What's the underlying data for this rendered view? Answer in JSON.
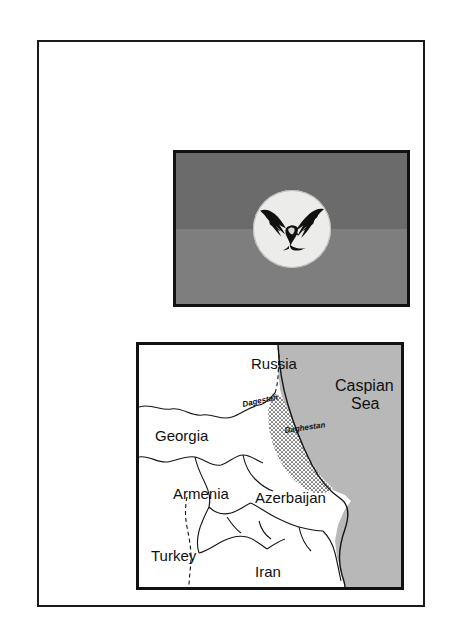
{
  "page": {
    "background_color": "#ffffff",
    "frame_color": "#1a1a1a"
  },
  "flag": {
    "name": "flag-of-dagestan-style-banner",
    "border_color": "#111111",
    "band_top_color": "#6b6b6b",
    "band_bottom_color": "#7e7e7e",
    "emblem": {
      "name": "eagle-emblem",
      "disc_color": "#ececea",
      "bird_color": "#111111",
      "description": "black eagle with spread wings on a pale disc"
    }
  },
  "map": {
    "name": "caucasus-caspian-region-map",
    "border_color": "#111111",
    "land_color": "#ffffff",
    "sea_color": "#b8b8b8",
    "boundary_color": "#141414",
    "sea_labels": [
      {
        "text": "Caspian",
        "x": 196,
        "y": 46
      },
      {
        "text": "Sea",
        "x": 212,
        "y": 64
      }
    ],
    "country_labels": [
      {
        "text": "Russia",
        "x": 112,
        "y": 24
      },
      {
        "text": "Georgia",
        "x": 16,
        "y": 96
      },
      {
        "text": "Armenia",
        "x": 34,
        "y": 154
      },
      {
        "text": "Azerbaijan",
        "x": 116,
        "y": 158
      },
      {
        "text": "Turkey",
        "x": 12,
        "y": 216
      },
      {
        "text": "Iran",
        "x": 116,
        "y": 232
      }
    ],
    "region_labels": [
      {
        "text": "Dagestan",
        "x": 104,
        "y": 62,
        "rotate": -12
      },
      {
        "text": "Daghestan",
        "x": 146,
        "y": 88,
        "rotate": -8
      }
    ]
  }
}
